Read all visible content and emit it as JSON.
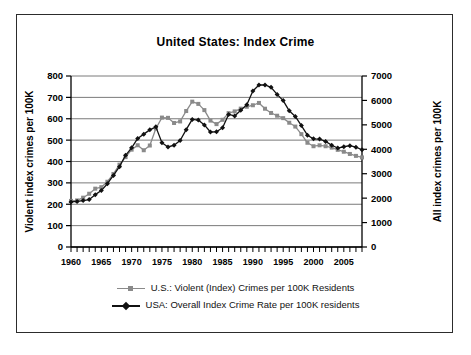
{
  "chart_data": {
    "type": "line",
    "title": "United States: Index Crime",
    "xlabel": "",
    "ylabel": "Violent index crimes per 100K",
    "y2label": "All index crimes per 100K",
    "xlim": [
      1960,
      2008
    ],
    "ylim": [
      0,
      800
    ],
    "y2lim": [
      0,
      7000
    ],
    "grid": true,
    "legend_position": "bottom",
    "x_tick_labels": [
      "1960",
      "1965",
      "1970",
      "1975",
      "1980",
      "1985",
      "1990",
      "1995",
      "2000",
      "2005"
    ],
    "x_tick_values": [
      1960,
      1965,
      1970,
      1975,
      1980,
      1985,
      1990,
      1995,
      2000,
      2005
    ],
    "x_minor_tick_step": 1,
    "y_tick_labels": [
      "0",
      "100",
      "200",
      "300",
      "400",
      "500",
      "600",
      "700",
      "800"
    ],
    "y_tick_values": [
      0,
      100,
      200,
      300,
      400,
      500,
      600,
      700,
      800
    ],
    "y2_tick_labels": [
      "0",
      "1000",
      "2000",
      "3000",
      "4000",
      "5000",
      "6000",
      "7000"
    ],
    "y2_tick_values": [
      0,
      1000,
      2000,
      3000,
      4000,
      5000,
      6000,
      7000
    ],
    "x": [
      1960,
      1961,
      1962,
      1963,
      1964,
      1965,
      1966,
      1967,
      1968,
      1969,
      1970,
      1971,
      1972,
      1973,
      1974,
      1975,
      1976,
      1977,
      1978,
      1979,
      1980,
      1981,
      1982,
      1983,
      1984,
      1985,
      1986,
      1987,
      1988,
      1989,
      1990,
      1991,
      1992,
      1993,
      1994,
      1995,
      1996,
      1997,
      1998,
      1999,
      2000,
      2001,
      2002,
      2003,
      2004,
      2005,
      2006,
      2007,
      2008
    ],
    "series": [
      {
        "name": "U.S.: Violent (Index) Crimes per 100K Residents",
        "axis": "right",
        "units": "all index crimes per 100K",
        "color": "#8a8a8a",
        "marker": "square",
        "values": [
          1887,
          1906,
          2019,
          2180,
          2388,
          2449,
          2671,
          2990,
          3370,
          3680,
          3985,
          4165,
          3961,
          4154,
          4850,
          5298,
          5287,
          5077,
          5140,
          5566,
          5950,
          5858,
          5604,
          5175,
          5031,
          5207,
          5480,
          5550,
          5664,
          5741,
          5803,
          5898,
          5661,
          5487,
          5374,
          5275,
          5087,
          4930,
          4620,
          4267,
          4125,
          4163,
          4125,
          4067,
          3977,
          3900,
          3809,
          3730,
          3667
        ]
      },
      {
        "name": "USA: Overall Index Crime Rate per 100K residents",
        "axis": "left",
        "units": "violent index crimes per 100K",
        "color": "#111111",
        "marker": "diamond",
        "values": [
          211,
          213,
          217,
          222,
          245,
          264,
          296,
          335,
          376,
          429,
          464,
          508,
          528,
          548,
          562,
          488,
          468,
          476,
          498,
          549,
          597,
          594,
          571,
          538,
          539,
          558,
          620,
          613,
          640,
          666,
          730,
          758,
          758,
          747,
          714,
          685,
          637,
          611,
          568,
          523,
          506,
          505,
          494,
          476,
          463,
          469,
          474,
          467,
          455
        ]
      }
    ]
  },
  "legend": {
    "items": [
      {
        "label": "U.S.: Violent (Index) Crimes per 100K Residents",
        "marker": "square-marker-icon",
        "color": "#8a8a8a"
      },
      {
        "label": "USA: Overall Index Crime Rate per 100K residents",
        "marker": "diamond-marker-icon",
        "color": "#111111"
      }
    ]
  }
}
